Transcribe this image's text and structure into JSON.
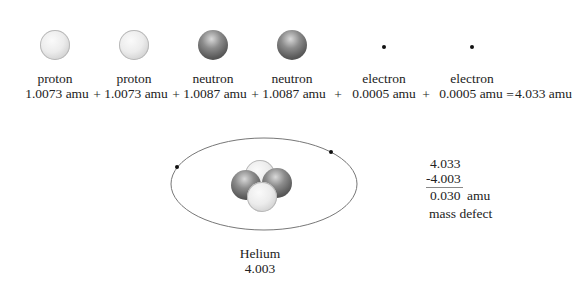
{
  "particles": [
    {
      "name": "proton",
      "mass": "1.0073 amu",
      "kind": "light"
    },
    {
      "name": "proton",
      "mass": "1.0073 amu",
      "kind": "light"
    },
    {
      "name": "neutron",
      "mass": "1.0087 amu",
      "kind": "dark"
    },
    {
      "name": "neutron",
      "mass": "1.0087 amu",
      "kind": "dark"
    },
    {
      "name": "electron",
      "mass": "0.0005 amu",
      "kind": "dot"
    },
    {
      "name": "electron",
      "mass": "0.0005 amu",
      "kind": "dot"
    }
  ],
  "operators": {
    "plus": "+",
    "equals": "=",
    "total": "4.033 amu"
  },
  "atom": {
    "name": "Helium",
    "mass": "4.003"
  },
  "calculation": {
    "line1": "4.033",
    "line2": "-4.003",
    "result": "0.030",
    "unit": "amu",
    "caption": "mass defect"
  }
}
